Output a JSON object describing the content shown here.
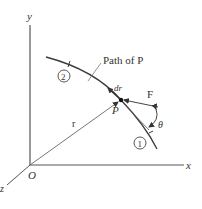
{
  "diagram": {
    "type": "vector-mechanics-work-diagram",
    "axes": {
      "x_label": "x",
      "y_label": "y",
      "z_label": "z",
      "origin_label": "O"
    },
    "path": {
      "label": "Path of P",
      "point_label": "P",
      "start_marker": "2",
      "end_marker": "1"
    },
    "vectors": {
      "position_label": "r",
      "displacement_label": "dr",
      "force_label": "F",
      "angle_label": "θ"
    },
    "colors": {
      "line": "#3a3a3a",
      "axis": "#555555",
      "text": "#333333",
      "background": "#ffffff"
    }
  }
}
